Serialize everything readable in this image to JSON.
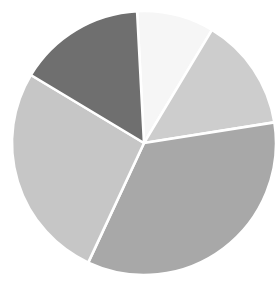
{
  "chart_data": {
    "type": "pie",
    "title": "",
    "subtitle": "",
    "xlabel": "",
    "ylabel": "",
    "grid": false,
    "legend": "none",
    "labels_shown": false,
    "categories": [
      "Slice 1",
      "Slice 2",
      "Slice 3",
      "Slice 4",
      "Slice 5"
    ],
    "values": [
      9.4,
      13.9,
      34.4,
      26.7,
      15.6
    ],
    "angles_deg": [
      34,
      50,
      124,
      96,
      56
    ],
    "colors": [
      "#f6f6f6",
      "#cdcdcd",
      "#a8a8a8",
      "#c6c6c6",
      "#6f6f6f"
    ],
    "start_angle_deg": -93,
    "direction": "clockwise",
    "center": {
      "cx": 144,
      "cy": 143
    },
    "radius": 132,
    "wedge_border_color": "#ffffff",
    "background_color": "#ffffff",
    "slices": [
      {
        "name": "Slice 1",
        "value": 9.4,
        "angle_deg": 34,
        "color": "#f6f6f6",
        "start_deg": -93,
        "end_deg": -59
      },
      {
        "name": "Slice 2",
        "value": 13.9,
        "angle_deg": 50,
        "color": "#cdcdcd",
        "start_deg": -59,
        "end_deg": -9
      },
      {
        "name": "Slice 3",
        "value": 34.4,
        "angle_deg": 124,
        "color": "#a8a8a8",
        "start_deg": -9,
        "end_deg": 115
      },
      {
        "name": "Slice 4",
        "value": 26.7,
        "angle_deg": 96,
        "color": "#c6c6c6",
        "start_deg": 115,
        "end_deg": 211
      },
      {
        "name": "Slice 5",
        "value": 15.6,
        "angle_deg": 56,
        "color": "#6f6f6f",
        "start_deg": 211,
        "end_deg": 267
      }
    ]
  }
}
